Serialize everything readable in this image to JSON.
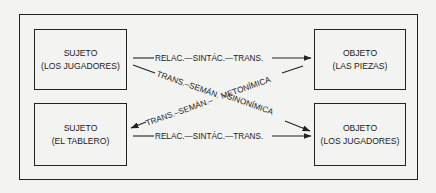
{
  "boxes": {
    "top_left": {
      "line1": "SUJETO",
      "line2": "(LOS JUGADORES)"
    },
    "top_right": {
      "line1": "OBJETO",
      "line2": "(LAS PIEZAS)"
    },
    "bottom_left": {
      "line1": "SUJETO",
      "line2": "(EL TABLERO)"
    },
    "bottom_right": {
      "line1": "OBJETO",
      "line2": "(LOS JUGADORES)"
    }
  },
  "arrows": {
    "top_horizontal": {
      "label": "RELAC.—SINTÁC.—TRANS."
    },
    "bottom_horizontal": {
      "label": "RELAC.—SINTÁC.—TRANS."
    },
    "diagonal_down": {
      "label_left": "TRANS.–SEMÁN.",
      "label_right": "–SINONÍMICA"
    },
    "diagonal_up": {
      "label_left": "TRANS.–SEMÁN.–",
      "label_right": "METONÍMICA"
    }
  },
  "colors": {
    "ink": "#222222",
    "paper": "#f3f3f1"
  }
}
